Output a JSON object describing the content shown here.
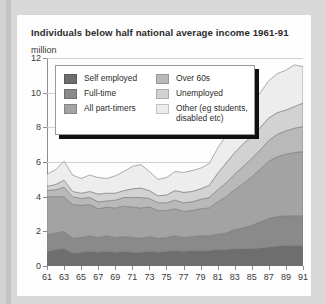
{
  "card": {
    "title": "Individuals below half national average income 1961-91",
    "units": "million"
  },
  "legend": {
    "left": [
      {
        "label": "Self employed",
        "color": "#6e6e6e"
      },
      {
        "label": "Full-time",
        "color": "#8a8a8a"
      },
      {
        "label": "All part-timers",
        "color": "#a3a3a3"
      }
    ],
    "right": [
      {
        "label": "Over 60s",
        "color": "#b9b9b9"
      },
      {
        "label": "Unemployed",
        "color": "#d2d2d2"
      },
      {
        "label": "Other (eg students, disabled etc)",
        "color": "#ededed"
      }
    ]
  },
  "chart_data": {
    "type": "area",
    "title": "Individuals below half national average income 1961-91",
    "xlabel": "",
    "ylabel": "million",
    "ylim": [
      0,
      12
    ],
    "yticks": [
      0,
      2,
      4,
      6,
      8,
      10,
      12
    ],
    "xlim": [
      61,
      91
    ],
    "xticks": [
      61,
      63,
      65,
      67,
      69,
      71,
      73,
      75,
      77,
      79,
      81,
      83,
      85,
      87,
      89,
      91
    ],
    "grid": true,
    "legend_position": "inside-top-left",
    "stacked": true,
    "x": [
      61,
      62,
      63,
      64,
      65,
      66,
      67,
      68,
      69,
      70,
      71,
      72,
      73,
      74,
      75,
      76,
      77,
      78,
      79,
      80,
      81,
      82,
      83,
      84,
      85,
      86,
      87,
      88,
      89,
      90,
      91
    ],
    "series": [
      {
        "name": "Self employed",
        "color": "#6e6e6e",
        "values": [
          0.85,
          0.95,
          1.0,
          0.75,
          0.8,
          0.85,
          0.8,
          0.85,
          0.8,
          0.85,
          0.8,
          0.8,
          0.85,
          0.8,
          0.85,
          0.9,
          0.85,
          0.9,
          0.9,
          0.9,
          0.95,
          0.95,
          1.0,
          1.0,
          1.0,
          1.05,
          1.1,
          1.15,
          1.2,
          1.2,
          1.2
        ]
      },
      {
        "name": "Full-time",
        "color": "#8a8a8a",
        "values": [
          0.95,
          0.95,
          1.0,
          0.85,
          0.85,
          0.9,
          0.85,
          0.9,
          0.85,
          0.85,
          0.85,
          0.8,
          0.85,
          0.8,
          0.8,
          0.85,
          0.8,
          0.8,
          0.85,
          0.85,
          0.9,
          0.95,
          1.1,
          1.2,
          1.35,
          1.5,
          1.65,
          1.7,
          1.7,
          1.7,
          1.7
        ]
      },
      {
        "name": "All part-timers",
        "color": "#a3a3a3",
        "values": [
          2.2,
          2.1,
          2.0,
          1.95,
          1.85,
          1.8,
          1.65,
          1.65,
          1.7,
          1.75,
          1.75,
          1.75,
          1.7,
          1.6,
          1.55,
          1.55,
          1.5,
          1.5,
          1.55,
          1.6,
          1.85,
          2.1,
          2.3,
          2.55,
          2.8,
          3.05,
          3.3,
          3.45,
          3.55,
          3.65,
          3.7
        ]
      },
      {
        "name": "Over 60s",
        "color": "#b9b9b9",
        "values": [
          0.35,
          0.4,
          0.55,
          0.45,
          0.4,
          0.4,
          0.4,
          0.35,
          0.45,
          0.5,
          0.55,
          0.6,
          0.5,
          0.45,
          0.45,
          0.5,
          0.5,
          0.5,
          0.55,
          0.6,
          0.7,
          0.8,
          0.9,
          1.0,
          1.05,
          1.1,
          1.2,
          1.3,
          1.35,
          1.4,
          1.45
        ]
      },
      {
        "name": "Unemployed",
        "color": "#d2d2d2",
        "values": [
          0.25,
          0.3,
          0.4,
          0.3,
          0.3,
          0.35,
          0.45,
          0.45,
          0.4,
          0.4,
          0.5,
          0.55,
          0.45,
          0.4,
          0.45,
          0.55,
          0.6,
          0.6,
          0.6,
          0.7,
          0.95,
          1.15,
          1.25,
          1.3,
          1.3,
          1.3,
          1.3,
          1.25,
          1.2,
          1.25,
          1.35
        ]
      },
      {
        "name": "Other (eg students, disabled etc)",
        "color": "#ededed",
        "values": [
          0.7,
          0.85,
          1.1,
          0.95,
          0.85,
          0.95,
          0.95,
          0.85,
          1.0,
          1.1,
          1.3,
          1.35,
          1.1,
          0.95,
          1.0,
          1.1,
          1.15,
          1.2,
          1.2,
          1.25,
          1.45,
          1.6,
          1.7,
          1.8,
          1.9,
          2.0,
          2.15,
          2.25,
          2.3,
          2.4,
          2.1
        ]
      }
    ]
  }
}
